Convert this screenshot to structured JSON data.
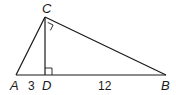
{
  "diagram": {
    "type": "right-triangle-with-altitude",
    "stroke_color": "#1a1a1a",
    "background": "#ffffff",
    "vertices": {
      "A": {
        "label": "A",
        "x": 16,
        "y": 75
      },
      "B": {
        "label": "B",
        "x": 166,
        "y": 75
      },
      "C": {
        "label": "C",
        "x": 45,
        "y": 17
      },
      "D": {
        "label": "D",
        "x": 45,
        "y": 75
      }
    },
    "segments": [
      {
        "from": "A",
        "to": "B"
      },
      {
        "from": "A",
        "to": "C"
      },
      {
        "from": "C",
        "to": "B"
      },
      {
        "from": "C",
        "to": "D",
        "role": "altitude"
      }
    ],
    "right_angles": [
      "C",
      "D"
    ],
    "measurements": {
      "AD": "3",
      "DB": "12"
    },
    "labels": {
      "A": "A",
      "B": "B",
      "C": "C",
      "D": "D",
      "AD": "3",
      "DB": "12"
    }
  }
}
